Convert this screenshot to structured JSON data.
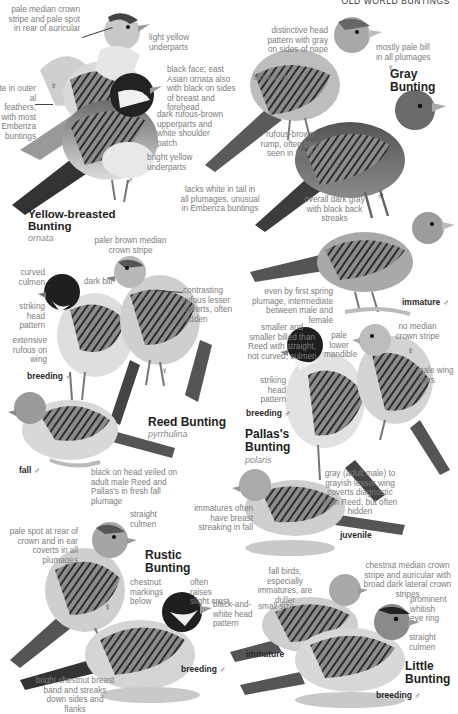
{
  "page": {
    "header": "OLD WORLD BUNTINGS"
  },
  "species": [
    {
      "name_line1": "Yellow-breasted",
      "name_line2": "Bunting",
      "subspecies": "ornata",
      "labels": {
        "female_sex": "♀",
        "male_sex": "♂"
      },
      "notes": [
        "pale median crown stripe and pale spot in rear of auricular",
        "light yellow underparts",
        "black face; east Asian ornata also with black on sides of breast and forehead",
        "dark rufous-brown upperparts and white shoulder patch",
        "bright yellow underparts",
        "te in outer al feathers, with most Emberiza buntings"
      ]
    },
    {
      "name": "Gray Bunting",
      "labels": {
        "female_sex": "♀",
        "male_sex": "♂",
        "immature": "immature",
        "immature_sex": "♂"
      },
      "notes": [
        "distinctive head pattern with gray on sides of nape",
        "mostly pale bill in all plumages",
        "large size",
        "rufous-brown rump, often best seen in flight",
        "lacks white in tail in all plumages, unusual in Emberiza buntings",
        "overall dark gray with black back streaks",
        "even by first spring plumage, intermediate between male and female"
      ]
    },
    {
      "name": "Reed Bunting",
      "subspecies": "pyrrhulina",
      "labels": {
        "breeding": "breeding",
        "breeding_sex": "♂",
        "female_sex": "♀",
        "fall": "fall",
        "fall_sex": "♂"
      },
      "notes": [
        "paler brown median crown stripe",
        "curved culmen",
        "dark bill",
        "contrasting rufous lesser coverts, often hidden",
        "striking head pattern",
        "extensive rufous on wing",
        "black on head veiled on adult male Reed and Pallas's in fresh fall plumage"
      ]
    },
    {
      "name_line1": "Pallas's",
      "name_line2": "Bunting",
      "subspecies": "polaris",
      "labels": {
        "breeding": "breeding",
        "breeding_sex": "♂",
        "female_sex": "♀",
        "juvenile": "juvenile"
      },
      "notes": [
        "smaller and smaller billed than Reed with straight, not curved, culmen",
        "pale lower mandible",
        "no median crown stripe",
        "pale wing bars",
        "striking head pattern",
        "gray (adult male) to grayish lesser wing coverts diagnostic from Reed, but often hidden",
        "immatures often have breast streaking in fall"
      ]
    },
    {
      "name_line1": "Rustic",
      "name_line2": "Bunting",
      "labels": {
        "female_sex": "♀",
        "breeding": "breeding",
        "breeding_sex": "♂"
      },
      "notes": [
        "straight culmen",
        "pale spot at rear of crown and in ear coverts in all plumages",
        "chestnut markings below",
        "often raises slight crest",
        "black-and-white head pattern",
        "bright chestnut breast band and streaks down sides and flanks"
      ]
    },
    {
      "name_line1": "Little",
      "name_line2": "Bunting",
      "labels": {
        "immature": "immature",
        "breeding": "breeding",
        "breeding_sex": "♂"
      },
      "notes": [
        "fall birds, especially immatures, are duller",
        "chestnut median crown stripe and auricular with broad dark lateral crown stripes",
        "small size",
        "prominent whitish eye ring",
        "straight culmen"
      ]
    }
  ]
}
